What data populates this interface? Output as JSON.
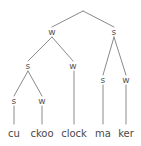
{
  "figure": {
    "name": "metrical-tree",
    "width": 141,
    "height": 146,
    "background_color": "#ffffff",
    "line_color": "#8a8a8a",
    "label_color": "#555353",
    "leaf_color": "#4b4949"
  },
  "nodes": [
    {
      "id": "root",
      "label": "",
      "x": 83,
      "y": 8
    },
    {
      "id": "n-w1",
      "label": "w",
      "x": 52,
      "y": 32
    },
    {
      "id": "n-s1",
      "label": "s",
      "x": 114,
      "y": 32
    },
    {
      "id": "n-s2",
      "label": "s",
      "x": 28,
      "y": 66
    },
    {
      "id": "n-w2",
      "label": "w",
      "x": 73,
      "y": 66
    },
    {
      "id": "n-s3",
      "label": "s",
      "x": 103,
      "y": 80
    },
    {
      "id": "n-w3",
      "label": "w",
      "x": 126,
      "y": 80
    },
    {
      "id": "n-s4",
      "label": "s",
      "x": 14,
      "y": 101
    },
    {
      "id": "n-w4",
      "label": "w",
      "x": 42,
      "y": 101
    }
  ],
  "edges": [
    {
      "from": "root",
      "to": "n-w1",
      "x1": 83,
      "y1": 11,
      "x2": 52,
      "y2": 27
    },
    {
      "from": "root",
      "to": "n-s1",
      "x1": 83,
      "y1": 11,
      "x2": 114,
      "y2": 27
    },
    {
      "from": "n-w1",
      "to": "n-s2",
      "x1": 52,
      "y1": 37,
      "x2": 28,
      "y2": 61
    },
    {
      "from": "n-w1",
      "to": "n-w2",
      "x1": 52,
      "y1": 37,
      "x2": 73,
      "y2": 61
    },
    {
      "from": "n-s1",
      "to": "n-s3",
      "x1": 114,
      "y1": 37,
      "x2": 103,
      "y2": 75
    },
    {
      "from": "n-s1",
      "to": "n-w3",
      "x1": 114,
      "y1": 37,
      "x2": 126,
      "y2": 75
    },
    {
      "from": "n-s2",
      "to": "n-s4",
      "x1": 28,
      "y1": 71,
      "x2": 14,
      "y2": 96
    },
    {
      "from": "n-s2",
      "to": "n-w4",
      "x1": 28,
      "y1": 71,
      "x2": 42,
      "y2": 96
    },
    {
      "from": "n-s4",
      "to": "leaf-cu",
      "x1": 14,
      "y1": 106,
      "x2": 14,
      "y2": 124
    },
    {
      "from": "n-w4",
      "to": "leaf-ckoo",
      "x1": 42,
      "y1": 106,
      "x2": 42,
      "y2": 124
    },
    {
      "from": "n-w2",
      "to": "leaf-clock",
      "x1": 74,
      "y1": 71,
      "x2": 74,
      "y2": 124
    },
    {
      "from": "n-s3",
      "to": "leaf-ma",
      "x1": 103,
      "y1": 85,
      "x2": 103,
      "y2": 124
    },
    {
      "from": "n-w3",
      "to": "leaf-ker",
      "x1": 126,
      "y1": 85,
      "x2": 126,
      "y2": 124
    }
  ],
  "leaves": [
    {
      "id": "leaf-cu",
      "label": "cu",
      "x": 14,
      "y": 134
    },
    {
      "id": "leaf-ckoo",
      "label": "ckoo",
      "x": 42,
      "y": 134
    },
    {
      "id": "leaf-clock",
      "label": "clock",
      "x": 74,
      "y": 134
    },
    {
      "id": "leaf-ma",
      "label": "ma",
      "x": 103,
      "y": 134
    },
    {
      "id": "leaf-ker",
      "label": "ker",
      "x": 126,
      "y": 134
    }
  ]
}
